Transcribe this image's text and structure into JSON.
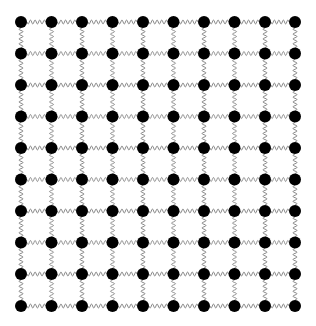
{
  "diagram": {
    "type": "lattice",
    "rows": 10,
    "cols": 10,
    "x_positions": [
      21,
      51.5,
      82,
      112.5,
      143,
      173.5,
      204,
      234.5,
      265,
      295
    ],
    "y_positions": [
      22,
      53.5,
      85,
      116.5,
      148,
      179.5,
      211,
      242.5,
      274,
      306
    ],
    "node": {
      "shape": "circle",
      "radius": 6,
      "color": "#000000",
      "label": "mass"
    },
    "edge": {
      "shape": "wavy-spring",
      "color": "#8a8a8a",
      "humps": 4,
      "amplitude": 2,
      "label": "spring"
    },
    "background": "#ffffff"
  }
}
